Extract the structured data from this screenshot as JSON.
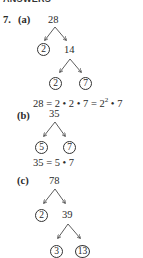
{
  "header": "ANSWERS",
  "problem_number": "7.",
  "parts": [
    {
      "label": "(a)",
      "root": "28",
      "level1": {
        "prime": "2",
        "composite": "14"
      },
      "level2": {
        "left": "2",
        "right": "7"
      },
      "result_prefix": "28 = 2 • 2 • 7 = 2",
      "result_exponent": "2",
      "result_suffix": " • 7"
    },
    {
      "label": "(b)",
      "root": "35",
      "level1": {
        "left": "5",
        "right": "7"
      },
      "result": "35 = 5 • 7"
    },
    {
      "label": "(c)",
      "root": "78",
      "level1": {
        "prime": "2",
        "composite": "39"
      },
      "level2": {
        "left": "3",
        "right": "13"
      }
    }
  ]
}
